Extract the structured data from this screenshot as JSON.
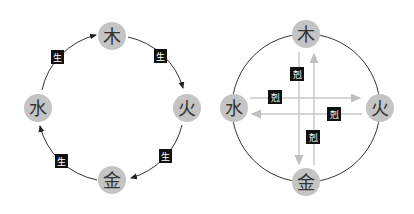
{
  "colors": {
    "node_fill": "#c4c4c4",
    "node_text": "#333333",
    "ring_line": "#333333",
    "arrow_gray": "#c8c8c8",
    "label_bg": "#111111",
    "label_text": "#ffffff"
  },
  "generating_cycle": {
    "title": "",
    "nodes": [
      {
        "id": "wood",
        "label": "木",
        "x": 112,
        "y": 38
      },
      {
        "id": "fire",
        "label": "火",
        "x": 187,
        "y": 108
      },
      {
        "id": "metal",
        "label": "金",
        "x": 112,
        "y": 180
      },
      {
        "id": "water",
        "label": "水",
        "x": 38,
        "y": 108
      }
    ],
    "edges": [
      {
        "from": "wood",
        "to": "fire",
        "label": "生"
      },
      {
        "from": "fire",
        "to": "metal",
        "label": "生"
      },
      {
        "from": "metal",
        "to": "water",
        "label": "生"
      },
      {
        "from": "water",
        "to": "wood",
        "label": "生"
      }
    ]
  },
  "overcoming_cycle": {
    "title": "",
    "nodes": [
      {
        "id": "wood",
        "label": "木",
        "x": 306,
        "y": 36
      },
      {
        "id": "fire",
        "label": "火",
        "x": 381,
        "y": 109
      },
      {
        "id": "metal",
        "label": "金",
        "x": 306,
        "y": 181
      },
      {
        "id": "water",
        "label": "水",
        "x": 233,
        "y": 106
      }
    ],
    "edges": [
      {
        "from": "wood",
        "to": "metal",
        "label": "剋"
      },
      {
        "from": "metal",
        "to": "wood",
        "label": "剋"
      },
      {
        "from": "water",
        "to": "fire",
        "label": "剋"
      },
      {
        "from": "fire",
        "to": "water",
        "label": "剋"
      }
    ]
  }
}
